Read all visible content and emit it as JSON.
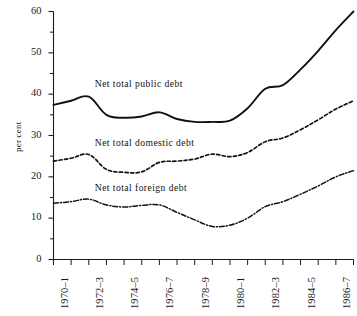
{
  "chart_data": {
    "type": "line",
    "title": "",
    "subtitle": "",
    "xlabel": "",
    "ylabel": "per cent",
    "ylim": [
      0,
      60
    ],
    "ytick_values": [
      0,
      10,
      20,
      30,
      40,
      50,
      60
    ],
    "ytick_labels": [
      "0",
      "10",
      "20",
      "30",
      "40",
      "50",
      "60"
    ],
    "yminor_values": [
      5,
      15,
      25,
      35,
      45,
      55
    ],
    "grid": false,
    "legend_position": "inline-annotations",
    "x": [
      "1970-1",
      "1971-2",
      "1972-3",
      "1973-4",
      "1974-5",
      "1975-6",
      "1976-7",
      "1977-8",
      "1978-9",
      "1979-80",
      "1980-1",
      "1981-2",
      "1982-3",
      "1983-4",
      "1984-5",
      "1985-6",
      "1986-7",
      "1987-8"
    ],
    "xtick_labels": [
      "1970–1",
      "1972–3",
      "1974–5",
      "1976–7",
      "1978–9",
      "1980–1",
      "1982–3",
      "1984–5",
      "1986–7"
    ],
    "xtick_label_every": 2,
    "series": [
      {
        "name": "Net total public debt",
        "style": "solid",
        "color": "#111111",
        "label_x": "1972-3",
        "label_y": 42.3,
        "values": [
          37.4,
          38.4,
          39.4,
          35.0,
          34.3,
          34.6,
          35.6,
          34.0,
          33.3,
          33.3,
          33.6,
          36.6,
          41.3,
          42.2,
          46.0,
          50.5,
          55.5,
          60.0
        ]
      },
      {
        "name": "Net total domestic debt",
        "style": "dashed",
        "color": "#111111",
        "label_x": "1972-3",
        "label_y": 28.0,
        "values": [
          23.8,
          24.5,
          25.4,
          21.8,
          21.1,
          21.2,
          23.5,
          23.8,
          24.3,
          25.5,
          24.9,
          25.9,
          28.5,
          29.4,
          31.4,
          33.8,
          36.4,
          38.4
        ]
      },
      {
        "name": "Net total foreign debt",
        "style": "dashdot",
        "color": "#111111",
        "label_x": "1972-3",
        "label_y": 17.1,
        "values": [
          13.6,
          14.0,
          14.6,
          13.2,
          12.7,
          13.1,
          13.2,
          11.4,
          9.6,
          8.0,
          8.3,
          10.0,
          12.8,
          14.0,
          15.8,
          17.8,
          20.0,
          21.5
        ]
      }
    ]
  },
  "axes": {
    "x_start_value": 0,
    "x_end_value": 17
  }
}
